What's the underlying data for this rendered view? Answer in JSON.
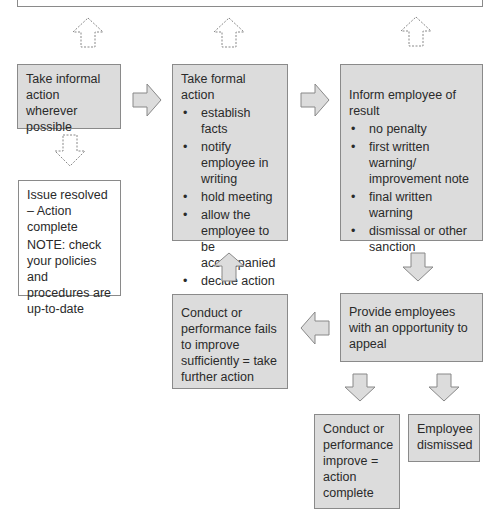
{
  "diagram": {
    "type": "flowchart",
    "colors": {
      "box_fill": "#dcdcdc",
      "box_border": "#8a8a8a",
      "arrow_fill": "#dcdcdc",
      "text": "#2a2a2a"
    },
    "nodes": {
      "informal": {
        "text": "Take informal action wherever possible"
      },
      "formal": {
        "title": "Take formal action",
        "items": [
          "establish facts",
          "notify employee in writing",
          "hold meeting",
          "allow the employee to be accompanied",
          "decide action"
        ]
      },
      "inform": {
        "title": "Inform employee of result",
        "items": [
          "no penalty",
          "first written warning/ improvement note",
          "final written warning",
          "dismissal or other sanction"
        ]
      },
      "resolved": {
        "text": "Issue resolved – Action complete",
        "note": "NOTE: check your policies and procedures are up-to-date"
      },
      "fails": {
        "text": "Conduct or performance fails to improve sufficiently = take further action"
      },
      "appeal": {
        "text": "Provide employees with an opportunity to appeal"
      },
      "improve": {
        "text": "Conduct or performance improve = action complete"
      },
      "dismissed": {
        "text": "Employee dismissed"
      }
    },
    "edges": [
      {
        "from": "informal",
        "to": "top",
        "style": "dashed",
        "direction": "up"
      },
      {
        "from": "formal",
        "to": "top",
        "style": "dashed",
        "direction": "up"
      },
      {
        "from": "inform",
        "to": "top",
        "style": "dashed",
        "direction": "up"
      },
      {
        "from": "informal",
        "to": "formal",
        "style": "solid",
        "direction": "right"
      },
      {
        "from": "formal",
        "to": "inform",
        "style": "solid",
        "direction": "right"
      },
      {
        "from": "informal",
        "to": "resolved",
        "style": "dashed",
        "direction": "down"
      },
      {
        "from": "inform",
        "to": "appeal",
        "style": "solid",
        "direction": "down"
      },
      {
        "from": "appeal",
        "to": "fails",
        "style": "solid",
        "direction": "left"
      },
      {
        "from": "fails",
        "to": "formal",
        "style": "solid",
        "direction": "up"
      },
      {
        "from": "appeal",
        "to": "improve",
        "style": "solid",
        "direction": "down"
      },
      {
        "from": "appeal",
        "to": "dismissed",
        "style": "solid",
        "direction": "down"
      }
    ]
  }
}
